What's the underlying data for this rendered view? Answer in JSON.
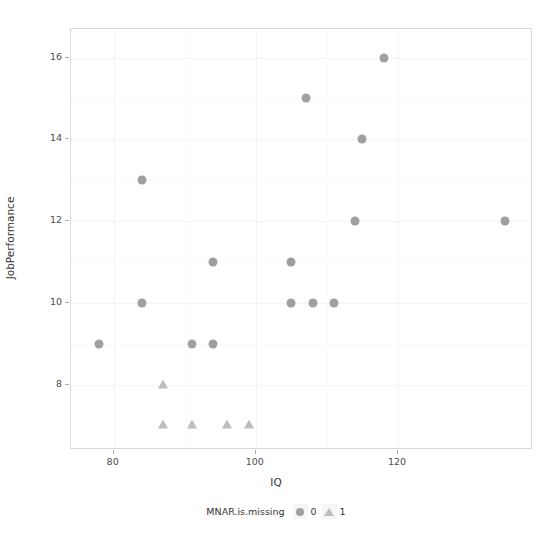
{
  "chart_data": {
    "type": "scatter",
    "title": "",
    "xlabel": "IQ",
    "ylabel": "JobPerformance",
    "xlim": [
      74,
      139
    ],
    "ylim": [
      6.4,
      16.7
    ],
    "xticks": [
      80,
      100,
      120
    ],
    "xtick_labels": [
      "80",
      "100",
      "120"
    ],
    "yticks": [
      8,
      10,
      12,
      14,
      16
    ],
    "ytick_labels": [
      "8",
      "10",
      "12",
      "14",
      "16"
    ],
    "grid": true,
    "legend_position": "bottom",
    "legend_title": "MNAR.is.missing",
    "series": [
      {
        "name": "0",
        "marker": "circle",
        "color": "#a0a0a0",
        "points": [
          {
            "x": 78,
            "y": 9
          },
          {
            "x": 84,
            "y": 13
          },
          {
            "x": 84,
            "y": 10
          },
          {
            "x": 91,
            "y": 9
          },
          {
            "x": 94,
            "y": 9
          },
          {
            "x": 94,
            "y": 11
          },
          {
            "x": 105,
            "y": 11
          },
          {
            "x": 105,
            "y": 10
          },
          {
            "x": 107,
            "y": 15
          },
          {
            "x": 108,
            "y": 10
          },
          {
            "x": 111,
            "y": 10
          },
          {
            "x": 114,
            "y": 12
          },
          {
            "x": 115,
            "y": 14
          },
          {
            "x": 118,
            "y": 16
          },
          {
            "x": 135,
            "y": 12
          }
        ]
      },
      {
        "name": "1",
        "marker": "triangle",
        "color": "#bdbdbd",
        "points": [
          {
            "x": 87,
            "y": 8
          },
          {
            "x": 87,
            "y": 7
          },
          {
            "x": 91,
            "y": 7
          },
          {
            "x": 96,
            "y": 7
          },
          {
            "x": 99,
            "y": 7
          }
        ]
      }
    ]
  },
  "axes": {
    "x_title": "IQ",
    "y_title": "JobPerformance"
  },
  "legend": {
    "title": "MNAR.is.missing",
    "entries": [
      {
        "label": "0",
        "icon": "circle-marker-icon"
      },
      {
        "label": "1",
        "icon": "triangle-marker-icon"
      }
    ]
  },
  "colors": {
    "marker_circle": "#a0a0a0",
    "marker_triangle": "#bdbdbd",
    "panel_border": "#d9d9d9",
    "gridline": "#f4f4f4",
    "text": "#4d4d4d",
    "background": "#ffffff"
  }
}
